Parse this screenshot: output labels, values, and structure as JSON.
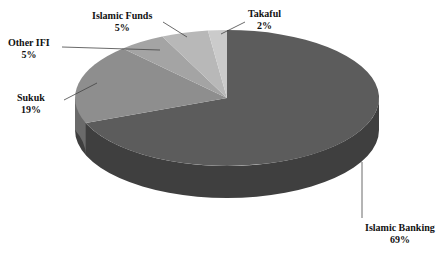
{
  "chart_data": {
    "type": "pie",
    "title": "",
    "subtitle": "",
    "xlabel": "",
    "ylabel": "",
    "legend_position": "none",
    "grid": false,
    "value_unit": "%",
    "three_d": true,
    "start_angle_deg": 0,
    "direction": "clockwise",
    "categories": [
      "Islamic Banking",
      "Sukuk",
      "Other IFI",
      "Islamic Funds",
      "Takaful"
    ],
    "values": [
      69,
      19,
      5,
      5,
      2
    ],
    "labels": [
      "69%",
      "19%",
      "5%",
      "5%",
      "2%"
    ],
    "colors": [
      "#5c5c5c",
      "#8e8e8e",
      "#a4a4a4",
      "#b8b8b8",
      "#cbcbcb"
    ],
    "side_colors": [
      "#3f3f3f",
      "#6a6a6a",
      "#7d7d7d",
      "#8e8e8e",
      "#9f9f9f"
    ],
    "slices": [
      {
        "name": "Islamic Banking",
        "value": 69,
        "label": "69%",
        "color": "#5c5c5c"
      },
      {
        "name": "Sukuk",
        "value": 19,
        "label": "19%",
        "color": "#8e8e8e"
      },
      {
        "name": "Other IFI",
        "value": 5,
        "label": "5%",
        "color": "#a4a4a4"
      },
      {
        "name": "Islamic Funds",
        "value": 5,
        "label": "5%",
        "color": "#b8b8b8"
      },
      {
        "name": "Takaful",
        "value": 2,
        "label": "2%",
        "color": "#cbcbcb"
      }
    ]
  },
  "callouts": {
    "islamic_funds": {
      "name": "Islamic Funds",
      "percent": "5%"
    },
    "takaful": {
      "name": "Takaful",
      "percent": "2%"
    },
    "other_ifi": {
      "name": "Other IFI",
      "percent": "5%"
    },
    "sukuk": {
      "name": "Sukuk",
      "percent": "19%"
    },
    "islamic_banking": {
      "name": "Islamic Banking",
      "percent": "69%"
    }
  }
}
